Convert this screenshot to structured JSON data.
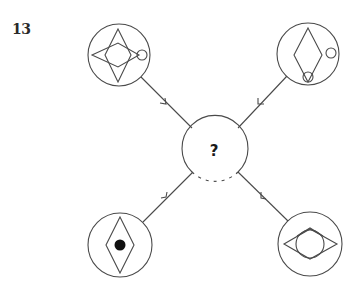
{
  "puzzle": {
    "number": "13",
    "center_label": "?",
    "stroke_color": "#4a4a4a",
    "fill_color": "#111111"
  },
  "nodes": [
    {
      "id": "top-left",
      "description": "circle containing a four-pointed star formed by a tall vertical diamond and a wide horizontal diamond, with a small circle at the right point"
    },
    {
      "id": "top-right",
      "description": "circle containing a vertical diamond, a small circle to its right, and a small circle at the bottom point of the diamond"
    },
    {
      "id": "bottom-left",
      "description": "circle containing a vertical diamond with a filled black dot in its center"
    },
    {
      "id": "bottom-right",
      "description": "circle containing a wide horizontal diamond overlapped by a circle and a chevron at the top"
    },
    {
      "id": "center",
      "description": "central circle with a question mark"
    }
  ],
  "connections": [
    {
      "from": "top-left",
      "to": "center",
      "arrow": "toward-center"
    },
    {
      "from": "top-right",
      "to": "center",
      "arrow": "toward-center"
    },
    {
      "from": "bottom-left",
      "to": "center",
      "arrow": "toward-center"
    },
    {
      "from": "bottom-right",
      "to": "center",
      "arrow": "toward-center"
    }
  ]
}
